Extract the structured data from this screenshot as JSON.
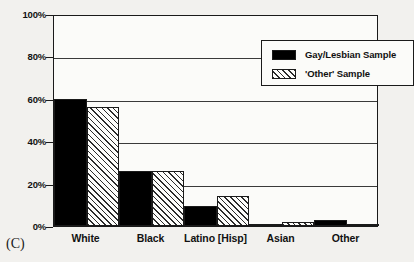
{
  "caption": "(C)",
  "legend": {
    "position": "top-right-inside",
    "entries": [
      {
        "label": "Gay/Lesbian Sample",
        "fill": "solid",
        "color": "#000000"
      },
      {
        "label": "'Other' Sample",
        "fill": "diagonal-hatch",
        "color": "#2b2b2b"
      }
    ]
  },
  "axes": {
    "y_ticks": [
      "100%",
      "80%",
      "60%",
      "40%",
      "20%",
      "0%"
    ],
    "x_ticks": [
      "White",
      "Black",
      "Latino [Hisp]",
      "Asian",
      "Other"
    ]
  },
  "chart_data": {
    "type": "bar",
    "title": "",
    "subtitle": "",
    "xlabel": "",
    "ylabel": "",
    "ylim": [
      0,
      100
    ],
    "yticks": [
      0,
      20,
      40,
      60,
      80,
      100
    ],
    "ytick_labels": [
      "0%",
      "20%",
      "40%",
      "60%",
      "80%",
      "100%"
    ],
    "grid": true,
    "legend_position": "top-right",
    "categories": [
      "White",
      "Black",
      "Latino [Hisp]",
      "Asian",
      "Other"
    ],
    "series": [
      {
        "name": "Gay/Lesbian Sample",
        "fill": "solid",
        "values": [
          60,
          26,
          9.5,
          1,
          3
        ]
      },
      {
        "name": "'Other' Sample",
        "fill": "diagonal-hatch",
        "values": [
          56,
          26,
          14,
          2,
          1
        ]
      }
    ],
    "annotations": [
      "(C)"
    ]
  }
}
